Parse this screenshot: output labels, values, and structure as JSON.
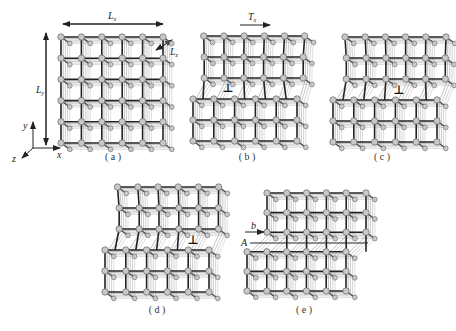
{
  "figure": {
    "background": "#ffffff",
    "line_color": "#222222",
    "back_line_color": "#8a8a8a",
    "node_fill": "#c8c8c8",
    "node_stroke": "#666666",
    "dislocation_symbol": "⊥"
  },
  "axes_indicator": {
    "y_label": "y",
    "x_label": "x",
    "z_label": "z"
  },
  "dimension_labels": {
    "Lx": "L",
    "Lx_sub": "x",
    "Ly": "L",
    "Ly_sub": "y",
    "Lz": "L",
    "Lz_sub": "z"
  },
  "shear_label": {
    "text": "T",
    "sub": "x"
  },
  "panels": [
    {
      "id": "a",
      "label": "( a )",
      "label_pos": [
        113,
        160
      ],
      "origin": [
        61,
        37
      ],
      "spacing": [
        20.4,
        21.2
      ],
      "cols": 6,
      "rows": 6,
      "type": "perfect"
    },
    {
      "id": "b",
      "label": "( b )",
      "label_pos": [
        247,
        160
      ],
      "origin": [
        203,
        36
      ],
      "spacing": [
        20.8,
        21.0
      ],
      "cols": 6,
      "rows": 6,
      "type": "dislocation",
      "step_row": 3,
      "step_offset": -10,
      "dislocation_col": 1.2,
      "symbol_pos": [
        228,
        92
      ]
    },
    {
      "id": "c",
      "label": "( c )",
      "label_pos": [
        382,
        160
      ],
      "origin": [
        343,
        37
      ],
      "spacing": [
        20.8,
        21.0
      ],
      "cols": 6,
      "rows": 6,
      "type": "dislocation",
      "step_row": 3,
      "step_offset": -10,
      "dislocation_col": 3.3,
      "symbol_pos": [
        399,
        94
      ]
    },
    {
      "id": "d",
      "label": "( d )",
      "label_pos": [
        157,
        313
      ],
      "origin": [
        115,
        187
      ],
      "spacing": [
        20.8,
        21.0
      ],
      "cols": 6,
      "rows": 6,
      "type": "dislocation",
      "step_row": 3,
      "step_offset": -10,
      "dislocation_col": 4.4,
      "symbol_pos": [
        193,
        244
      ]
    },
    {
      "id": "e",
      "label": "( e )",
      "label_pos": [
        304,
        313
      ],
      "origin": [
        267,
        193
      ],
      "spacing": [
        19.8,
        19.6
      ],
      "cols": 6,
      "rows": 6,
      "type": "slipped",
      "step_row": 3,
      "step_offset": -20,
      "A_label": "A",
      "b_label": "b",
      "A_line_y": 243,
      "b_arrow_y": 232
    }
  ]
}
